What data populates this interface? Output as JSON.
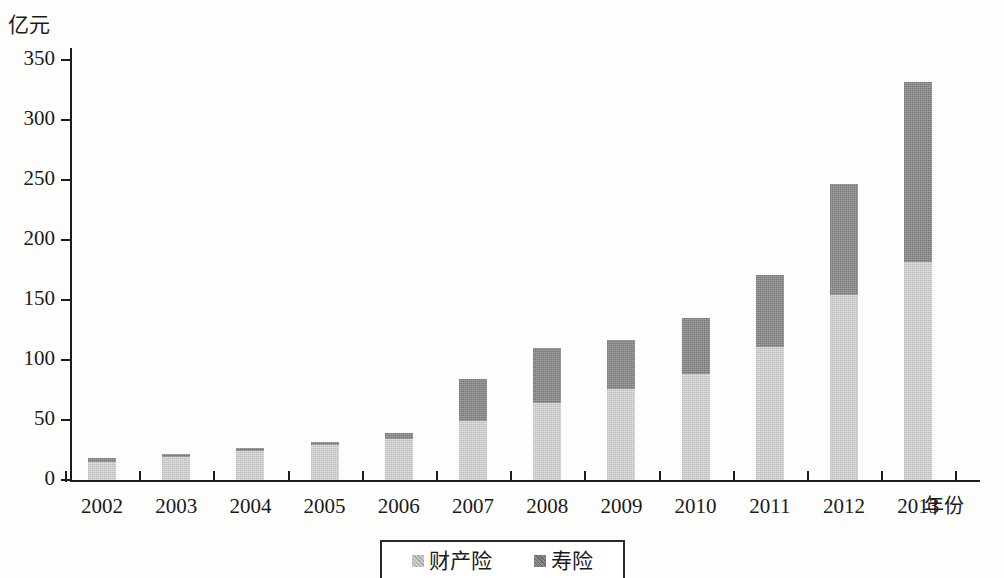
{
  "chart_data": {
    "type": "bar",
    "stacked": true,
    "title": "",
    "xlabel": "年份",
    "ylabel": "亿元",
    "ylim": [
      0,
      350
    ],
    "ytick_step": 50,
    "yticks": [
      "0",
      "50",
      "100",
      "150",
      "200",
      "250",
      "300",
      "350"
    ],
    "grid": false,
    "legend_position": "bottom-center",
    "categories": [
      "2002",
      "2003",
      "2004",
      "2005",
      "2006",
      "2007",
      "2008",
      "2009",
      "2010",
      "2011",
      "2012",
      "2013"
    ],
    "series": [
      {
        "name": "财产险",
        "color": "#cccccc",
        "values": [
          15,
          19,
          24,
          29,
          34,
          49,
          64,
          76,
          88,
          111,
          154,
          182
        ]
      },
      {
        "name": "寿险",
        "color": "#8a8a8a",
        "values": [
          3,
          3,
          3,
          3,
          5,
          35,
          46,
          41,
          47,
          60,
          93,
          150
        ]
      }
    ],
    "totals": [
      18,
      22,
      27,
      32,
      39,
      84,
      110,
      117,
      135,
      171,
      247,
      332
    ]
  },
  "axis": {
    "y_unit_label": "亿元",
    "x_title": "年份"
  },
  "legend": {
    "items": [
      {
        "label": "财产险",
        "swatch": "light-grey-swatch"
      },
      {
        "label": "寿险",
        "swatch": "dark-grey-swatch"
      }
    ]
  }
}
